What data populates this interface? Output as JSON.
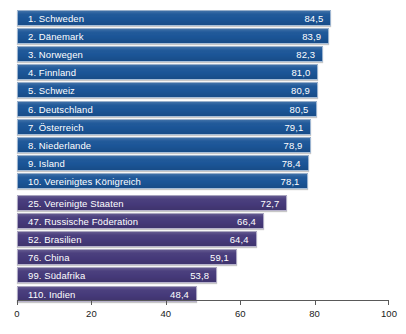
{
  "chart_data": {
    "type": "bar",
    "orientation": "horizontal",
    "title": "",
    "xlabel": "",
    "ylabel": "",
    "xlim": [
      0,
      100
    ],
    "grid": false,
    "legend": null,
    "axis": {
      "ticks": [
        0,
        20,
        40,
        60,
        80,
        100
      ],
      "tick_labels": [
        "0",
        "20",
        "40",
        "60",
        "80",
        "100"
      ]
    },
    "categories": [
      "1. Schweden",
      "2. Dänemark",
      "3. Norwegen",
      "4. Finnland",
      "5. Schweiz",
      "6. Deutschland",
      "7. Österreich",
      "8. Niederlande",
      "9. Island",
      "10. Vereinigtes Königreich",
      "25. Vereinigte Staaten",
      "47. Russische Föderation",
      "52. Brasilien",
      "76. China",
      "99. Südafrika",
      "110. Indien"
    ],
    "values": [
      84.5,
      83.9,
      82.3,
      81.0,
      80.9,
      80.5,
      79.1,
      78.9,
      78.4,
      78.1,
      72.7,
      66.4,
      64.4,
      59.1,
      53.8,
      48.4
    ],
    "value_labels": [
      "84,5",
      "83,9",
      "82,3",
      "81,0",
      "80,9",
      "80,5",
      "79,1",
      "78,9",
      "78,4",
      "78,1",
      "72,7",
      "66,4",
      "64,4",
      "59,1",
      "53,8",
      "48,4"
    ],
    "colors": {
      "top_group": "#1b5597",
      "other_group": "#463a7a",
      "axis": "#595959",
      "label_text": "#ffffff",
      "tick_text": "#1a1a1a",
      "background": "#ffffff"
    },
    "bars": [
      {
        "rank": "1",
        "label": "1. Schweden",
        "value": 84.5,
        "value_label": "84,5",
        "group": "top"
      },
      {
        "rank": "2",
        "label": "2. Dänemark",
        "value": 83.9,
        "value_label": "83,9",
        "group": "top"
      },
      {
        "rank": "3",
        "label": "3. Norwegen",
        "value": 82.3,
        "value_label": "82,3",
        "group": "top"
      },
      {
        "rank": "4",
        "label": "4. Finnland",
        "value": 81.0,
        "value_label": "81,0",
        "group": "top"
      },
      {
        "rank": "5",
        "label": "5. Schweiz",
        "value": 80.9,
        "value_label": "80,9",
        "group": "top"
      },
      {
        "rank": "6",
        "label": "6. Deutschland",
        "value": 80.5,
        "value_label": "80,5",
        "group": "top"
      },
      {
        "rank": "7",
        "label": "7. Österreich",
        "value": 79.1,
        "value_label": "79,1",
        "group": "top"
      },
      {
        "rank": "8",
        "label": "8. Niederlande",
        "value": 78.9,
        "value_label": "78,9",
        "group": "top"
      },
      {
        "rank": "9",
        "label": "9. Island",
        "value": 78.4,
        "value_label": "78,4",
        "group": "top"
      },
      {
        "rank": "10",
        "label": "10. Vereinigtes Königreich",
        "value": 78.1,
        "value_label": "78,1",
        "group": "top"
      },
      {
        "rank": "25",
        "label": "25. Vereinigte Staaten",
        "value": 72.7,
        "value_label": "72,7",
        "group": "other"
      },
      {
        "rank": "47",
        "label": "47. Russische Föderation",
        "value": 66.4,
        "value_label": "66,4",
        "group": "other"
      },
      {
        "rank": "52",
        "label": "52. Brasilien",
        "value": 64.4,
        "value_label": "64,4",
        "group": "other"
      },
      {
        "rank": "76",
        "label": "76. China",
        "value": 59.1,
        "value_label": "59,1",
        "group": "other"
      },
      {
        "rank": "99",
        "label": "99. Südafrika",
        "value": 53.8,
        "value_label": "53,8",
        "group": "other"
      },
      {
        "rank": "110",
        "label": "110. Indien",
        "value": 48.4,
        "value_label": "48,4",
        "group": "other"
      }
    ]
  }
}
